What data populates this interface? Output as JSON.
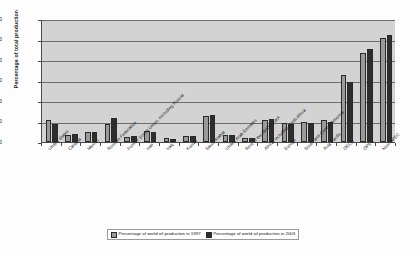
{
  "chart_data": {
    "type": "bar",
    "title": "",
    "xlabel": "",
    "ylabel": "Percentage of total production",
    "ylim": [
      0,
      60
    ],
    "yticks": [
      0,
      10,
      20,
      30,
      40,
      50,
      60
    ],
    "grid": true,
    "legend_position": "bottom",
    "categories": [
      "United States",
      "Canada",
      "Mexico",
      "Russian Federation",
      "Former Soviet Union, excluding Russia",
      "Iran",
      "Iraq",
      "Kuwait",
      "Saudi Arabia",
      "United Arab Emirates",
      "Rest of the Middle East",
      "Africa, including North Africa",
      "Europe",
      "South and Central America",
      "Asia Pacific",
      "OECD",
      "OPEC",
      "Non-OPEC"
    ],
    "series": [
      {
        "name": "Percentage of world oil production in 1997",
        "color": "#9a9a9a",
        "values": [
          10.5,
          3.6,
          5.0,
          9.0,
          2.5,
          5.2,
          1.8,
          3.1,
          12.7,
          3.5,
          2.0,
          10.5,
          9.5,
          10.0,
          10.5,
          32.5,
          43.5,
          50.5
        ]
      },
      {
        "name": "Percentage of world oil production in 2003",
        "color": "#2e2e2e",
        "values": [
          9.0,
          3.7,
          5.1,
          11.5,
          3.0,
          5.0,
          1.7,
          2.9,
          13.0,
          3.3,
          1.9,
          11.0,
          9.0,
          9.5,
          10.0,
          29.5,
          45.5,
          52.0
        ]
      }
    ]
  },
  "axis": {
    "y_title": "Percentage of total production",
    "tick_labels": [
      "60",
      "50",
      "40",
      "30",
      "20",
      "10",
      "0"
    ]
  },
  "legend": {
    "items": [
      {
        "label": "Percentage of world oil production in 1997"
      },
      {
        "label": "Percentage of world oil production in 2003"
      }
    ]
  }
}
